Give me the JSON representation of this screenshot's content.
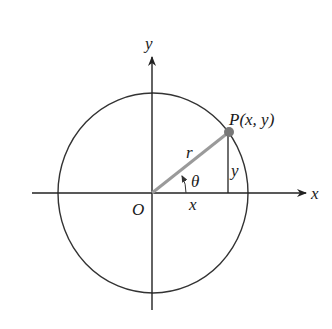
{
  "diagram": {
    "labels": {
      "y_axis": "y",
      "x_axis": "x",
      "origin": "O",
      "point": "P(x, y)",
      "radius": "r",
      "angle": "θ",
      "x_leg": "x",
      "y_leg": "y"
    },
    "colors": {
      "axes": "#222222",
      "circle": "#333333",
      "radius_line": "#9a9a9a",
      "point": "#777777"
    }
  }
}
